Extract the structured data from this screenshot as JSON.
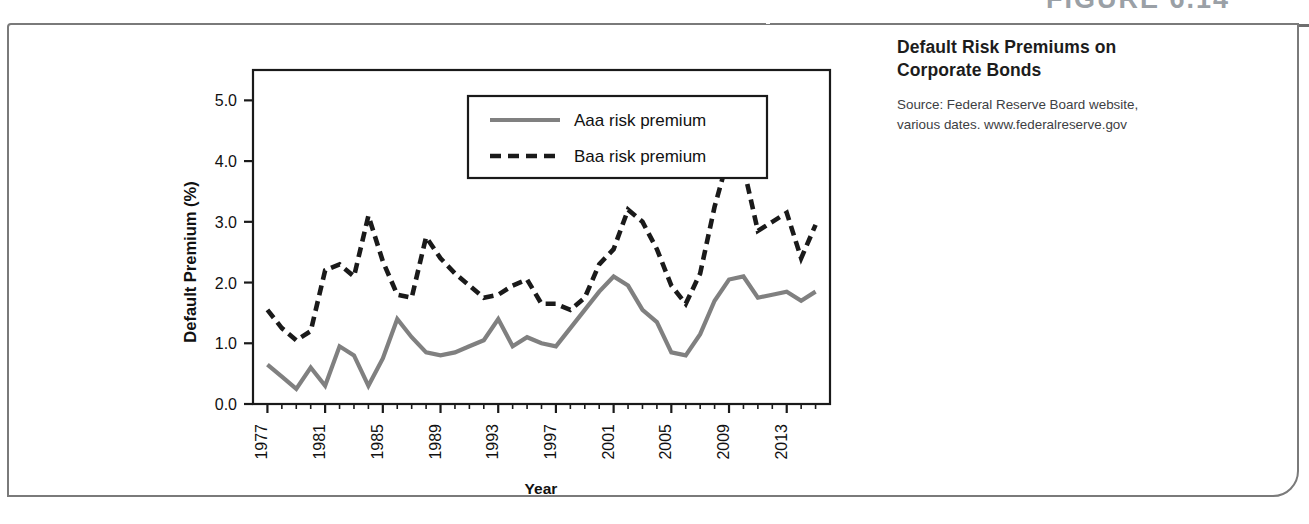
{
  "figure": {
    "heading": "FIGURE 6.14",
    "caption_title": "Default Risk Premiums on Corporate Bonds",
    "caption_source": "Source: Federal Reserve Board website, various dates. www.federalreserve.gov"
  },
  "colors": {
    "aaa_line": "#808080",
    "baa_line": "#1a1a1a",
    "axis": "#1a1a1a",
    "box_border": "#7a7a7a",
    "rule": "#6e6e6e",
    "heading_text": "#9aa0a6",
    "caption_title_text": "#1c1c1c",
    "caption_source_text": "#3d4043",
    "plot_background": "#ffffff"
  },
  "chart_data": {
    "type": "line",
    "title": "Default Risk Premiums on Corporate Bonds",
    "xlabel": "Year",
    "ylabel": "Default Premium (%)",
    "xlim": [
      1976,
      2016
    ],
    "ylim": [
      0.0,
      5.5
    ],
    "ytick_labels": [
      "0.0",
      "1.0",
      "2.0",
      "3.0",
      "4.0",
      "5.0"
    ],
    "ytick_values": [
      0.0,
      1.0,
      2.0,
      3.0,
      4.0,
      5.0
    ],
    "xtick_labels": [
      "1977",
      "1981",
      "1985",
      "1989",
      "1993",
      "1997",
      "2001",
      "2005",
      "2009",
      "2013"
    ],
    "xtick_values": [
      1977,
      1981,
      1985,
      1989,
      1993,
      1997,
      2001,
      2005,
      2009,
      2013
    ],
    "grid": false,
    "legend_position": "top-center-inside",
    "x": [
      1977,
      1978,
      1979,
      1980,
      1981,
      1982,
      1983,
      1984,
      1985,
      1986,
      1987,
      1988,
      1989,
      1990,
      1991,
      1992,
      1993,
      1994,
      1995,
      1996,
      1997,
      1998,
      1999,
      2000,
      2001,
      2002,
      2003,
      2004,
      2005,
      2006,
      2007,
      2008,
      2009,
      2010,
      2011,
      2012,
      2013,
      2014,
      2015
    ],
    "series": [
      {
        "name": "Aaa risk premium",
        "style": "solid",
        "color": "#808080",
        "values": [
          0.65,
          0.45,
          0.25,
          0.6,
          0.3,
          0.95,
          0.8,
          0.3,
          0.75,
          1.4,
          1.1,
          0.85,
          0.8,
          0.85,
          0.95,
          1.05,
          1.4,
          0.95,
          1.1,
          1.0,
          0.95,
          1.25,
          1.55,
          1.85,
          2.1,
          1.95,
          1.55,
          1.35,
          0.85,
          0.8,
          1.15,
          1.7,
          2.05,
          2.1,
          1.75,
          1.8,
          1.85,
          1.7,
          1.85
        ]
      },
      {
        "name": "Baa risk premium",
        "style": "dashed",
        "color": "#1a1a1a",
        "values": [
          1.55,
          1.25,
          1.05,
          1.2,
          2.2,
          2.3,
          2.1,
          3.1,
          2.35,
          1.8,
          1.75,
          2.75,
          2.4,
          2.15,
          1.95,
          1.75,
          1.8,
          1.95,
          2.05,
          1.65,
          1.65,
          1.55,
          1.75,
          2.3,
          2.55,
          3.2,
          3.0,
          2.55,
          1.95,
          1.65,
          2.15,
          3.25,
          4.1,
          3.9,
          2.85,
          3.0,
          3.15,
          2.4,
          2.95
        ]
      }
    ]
  }
}
